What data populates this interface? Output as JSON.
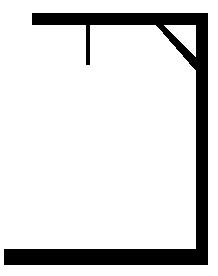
{
  "drawing": {
    "name": "hangman-gallows",
    "title": "Hangman gallows",
    "description": "Line drawing of a hangman gallows: horizontal base, vertical right post, horizontal top beam, diagonal corner brace, and a short hanging rope.",
    "canvas": {
      "width": 218,
      "height": 276,
      "background_color": "#ffffff"
    },
    "stroke_color": "#000000",
    "parts": [
      {
        "name": "base-beam",
        "label": "Base",
        "shape": "rect",
        "x": 4,
        "y": 249,
        "width": 204,
        "height": 16
      },
      {
        "name": "vertical-post",
        "label": "Post",
        "shape": "rect",
        "x": 196,
        "y": 13,
        "width": 12,
        "height": 252
      },
      {
        "name": "top-beam",
        "label": "Top beam",
        "shape": "rect",
        "x": 32,
        "y": 13,
        "width": 176,
        "height": 12
      },
      {
        "name": "diagonal-brace",
        "label": "Brace",
        "shape": "polygon",
        "points": "163,25 196,58 196,71 156,25"
      },
      {
        "name": "hanging-rope",
        "label": "Rope",
        "shape": "rect",
        "x": 86,
        "y": 25,
        "width": 4,
        "height": 40
      }
    ]
  }
}
